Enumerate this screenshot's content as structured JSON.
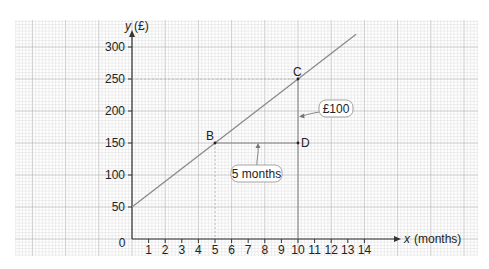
{
  "chart_data": {
    "type": "line",
    "title": "",
    "xlabel": "x (months)",
    "ylabel": "y (£)",
    "x_axis_symbol": "x",
    "x_axis_unit": "(months)",
    "y_axis_symbol": "y",
    "y_axis_unit": "(£)",
    "xlim": [
      0,
      14
    ],
    "ylim": [
      0,
      300
    ],
    "x_ticks": [
      1,
      2,
      3,
      4,
      5,
      6,
      7,
      8,
      9,
      10,
      11,
      12,
      13,
      14
    ],
    "y_ticks": [
      50,
      100,
      150,
      200,
      250,
      300
    ],
    "origin_label": "0",
    "grid": true,
    "series": [
      {
        "name": "line",
        "x": [
          0,
          5,
          10,
          13.5
        ],
        "y": [
          50,
          150,
          250,
          320
        ]
      }
    ],
    "points": [
      {
        "label": "B",
        "x": 5,
        "y": 150
      },
      {
        "label": "C",
        "x": 10,
        "y": 250
      },
      {
        "label": "D",
        "x": 10,
        "y": 150
      }
    ],
    "annotations": [
      {
        "text": "5 months",
        "target": "horizontal segment B–D"
      },
      {
        "text": "£100",
        "target": "vertical segment D–C"
      }
    ]
  },
  "colors": {
    "grid_minor": "#dcdcdc",
    "grid_major": "#bdbdbd",
    "axis": "#333333",
    "line": "#8a8a8a"
  }
}
